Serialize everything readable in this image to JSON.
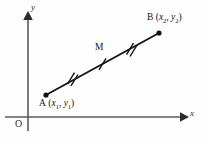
{
  "figure": {
    "background_color": "#fefefe",
    "stroke_color": "#1a1a1a",
    "axis_color": "#555555"
  },
  "axes": {
    "x_axis_label": "x",
    "y_axis_label": "y",
    "origin_label": "O",
    "x_axis": {
      "x1": 5,
      "y1": 117,
      "x2": 184,
      "y2": 117
    },
    "y_axis": {
      "x1": 28,
      "y1": 131,
      "x2": 28,
      "y2": 16
    }
  },
  "points": {
    "a": {
      "name": "A",
      "label": "A (x1, y1)",
      "label_letter": "A",
      "coord_x": "x",
      "coord_x_sub": "1",
      "coord_y": "y",
      "coord_y_sub": "1",
      "cx": 46,
      "cy": 95
    },
    "b": {
      "name": "B",
      "label": "B (x2, y2)",
      "label_letter": "B",
      "coord_x": "x",
      "coord_x_sub": "2",
      "coord_y": "y",
      "coord_y_sub": "2",
      "cx": 159,
      "cy": 33
    },
    "m": {
      "name": "M",
      "label": "M",
      "cx": 102,
      "cy": 64
    }
  },
  "segment": {
    "from": "A",
    "to": "B",
    "ticks": [
      {
        "name": "tick-double-left",
        "x": 72,
        "y": 78,
        "count": 2
      },
      {
        "name": "tick-single-mid",
        "x": 103,
        "y": 64,
        "count": 1
      },
      {
        "name": "tick-double-right",
        "x": 131,
        "y": 49,
        "count": 2
      }
    ]
  }
}
